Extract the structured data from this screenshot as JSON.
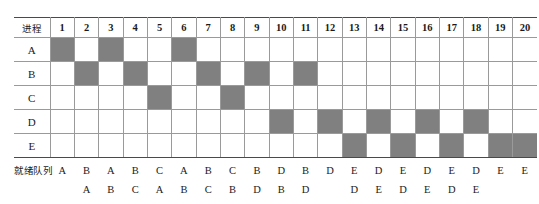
{
  "figure": {
    "top_caption": "",
    "process_header_label": "进程",
    "queue_label": "就绪队列",
    "fill_color": "#808080",
    "grid_line_color": "#9a9a9a",
    "border_color": "#4a4a4a"
  },
  "time_slots": [
    "1",
    "2",
    "3",
    "4",
    "5",
    "6",
    "7",
    "8",
    "9",
    "10",
    "11",
    "12",
    "13",
    "14",
    "15",
    "16",
    "17",
    "18",
    "19",
    "20"
  ],
  "processes": [
    {
      "name": "A",
      "cells": [
        "filled",
        "",
        "filled",
        "",
        "",
        "filled",
        "",
        "",
        "",
        "",
        "",
        "",
        "",
        "",
        "",
        "",
        "",
        "",
        "",
        ""
      ]
    },
    {
      "name": "B",
      "cells": [
        "",
        "filled",
        "",
        "filled",
        "",
        "",
        "filled",
        "",
        "filled",
        "",
        "filled",
        "",
        "",
        "",
        "",
        "",
        "",
        "",
        "",
        ""
      ]
    },
    {
      "name": "C",
      "cells": [
        "",
        "",
        "",
        "",
        "filled",
        "",
        "",
        "filled",
        "",
        "",
        "",
        "",
        "",
        "",
        "",
        "",
        "",
        "",
        "",
        ""
      ]
    },
    {
      "name": "D",
      "cells": [
        "",
        "",
        "",
        "",
        "",
        "",
        "",
        "",
        "",
        "filled",
        "",
        "filled",
        "",
        "filled",
        "",
        "filled",
        "",
        "filled",
        "",
        ""
      ]
    },
    {
      "name": "E",
      "cells": [
        "",
        "",
        "",
        "",
        "",
        "",
        "",
        "",
        "",
        "",
        "",
        "",
        "filled",
        "",
        "filled",
        "",
        "filled",
        "",
        "filled",
        "filled"
      ]
    }
  ],
  "ready_queue": {
    "row1": [
      "A",
      "B",
      "A",
      "B",
      "C",
      "A",
      "B",
      "C",
      "B",
      "D",
      "B",
      "D",
      "E",
      "D",
      "E",
      "D",
      "E",
      "D",
      "E",
      "E"
    ],
    "row2": [
      "",
      "A",
      "B",
      "C",
      "A",
      "B",
      "C",
      "B",
      "D",
      "B",
      "D",
      "",
      "D",
      "E",
      "D",
      "E",
      "D",
      "E",
      "",
      ""
    ]
  },
  "chart_data": {
    "type": "table",
    "xlabel": "时间片 (time slot)",
    "ylabel": "进程 (process)",
    "categories": [
      "1",
      "2",
      "3",
      "4",
      "5",
      "6",
      "7",
      "8",
      "9",
      "10",
      "11",
      "12",
      "13",
      "14",
      "15",
      "16",
      "17",
      "18",
      "19",
      "20"
    ],
    "series": [
      {
        "name": "A",
        "values": [
          1,
          0,
          1,
          0,
          0,
          1,
          0,
          0,
          0,
          0,
          0,
          0,
          0,
          0,
          0,
          0,
          0,
          0,
          0,
          0
        ]
      },
      {
        "name": "B",
        "values": [
          0,
          1,
          0,
          1,
          0,
          0,
          1,
          0,
          1,
          0,
          1,
          0,
          0,
          0,
          0,
          0,
          0,
          0,
          0,
          0
        ]
      },
      {
        "name": "C",
        "values": [
          0,
          0,
          0,
          0,
          1,
          0,
          0,
          1,
          0,
          0,
          0,
          0,
          0,
          0,
          0,
          0,
          0,
          0,
          0,
          0
        ]
      },
      {
        "name": "D",
        "values": [
          0,
          0,
          0,
          0,
          0,
          0,
          0,
          0,
          0,
          1,
          0,
          1,
          0,
          1,
          0,
          1,
          0,
          1,
          0,
          0
        ]
      },
      {
        "name": "E",
        "values": [
          0,
          0,
          0,
          0,
          0,
          0,
          0,
          0,
          0,
          0,
          0,
          0,
          1,
          0,
          1,
          0,
          1,
          0,
          1,
          1
        ]
      }
    ],
    "running_process_by_slot": [
      "A",
      "B",
      "A",
      "B",
      "C",
      "A",
      "B",
      "C",
      "B",
      "D",
      "B",
      "D",
      "E",
      "D",
      "E",
      "D",
      "E",
      "D",
      "E",
      "E"
    ],
    "ready_queue_row1": [
      "A",
      "B",
      "A",
      "B",
      "C",
      "A",
      "B",
      "C",
      "B",
      "D",
      "B",
      "D",
      "E",
      "D",
      "E",
      "D",
      "E",
      "D",
      "E",
      "E"
    ],
    "ready_queue_row2": [
      "",
      "A",
      "B",
      "C",
      "A",
      "B",
      "C",
      "B",
      "D",
      "B",
      "D",
      "",
      "D",
      "E",
      "D",
      "E",
      "D",
      "E",
      "",
      ""
    ],
    "legend": [
      "filled cell = process occupies CPU in that time slot"
    ],
    "grid": true
  }
}
